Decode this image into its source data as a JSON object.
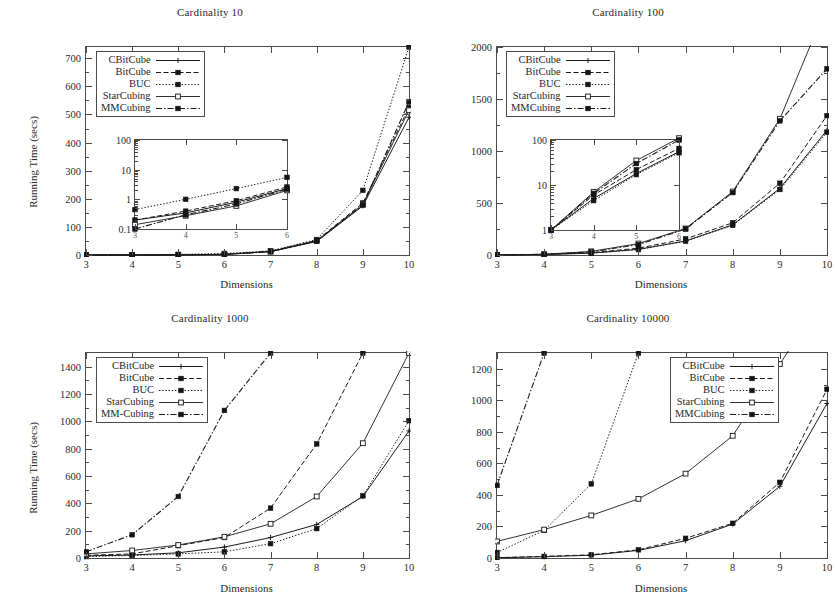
{
  "figure": {
    "background": "#ffffff",
    "ink": "#1a1a1a",
    "axis_color": "#4a4a4a"
  },
  "common": {
    "xlabel": "Dimensions",
    "ylabel": "Running Time (secs)",
    "x_ticks": [
      "3",
      "4",
      "5",
      "6",
      "7",
      "8",
      "9",
      "10"
    ],
    "series_names": [
      "CBitCube",
      "BitCube",
      "BUC",
      "StarCubing",
      "MMCubing"
    ]
  },
  "panels": [
    {
      "id": "cardinality-10",
      "title": "Cardinality 10",
      "ylabel": "Running Time (secs)",
      "xlabel": "Dimensions",
      "legend_position": "top-left",
      "legend_labels": [
        "CBitCube",
        "BitCube",
        "BUC",
        "StarCubing",
        "MMCubing"
      ],
      "y_ticks": [
        "0",
        "100",
        "200",
        "300",
        "400",
        "500",
        "600",
        "700"
      ],
      "inset": {
        "y_ticks": [
          "0.1",
          "1",
          "10",
          "100"
        ],
        "x_ticks": [
          "3",
          "4",
          "5",
          "6"
        ]
      },
      "chart_data": {
        "type": "line",
        "title": "Cardinality 10",
        "xlabel": "Dimensions",
        "ylabel": "Running Time (secs)",
        "x": [
          3,
          4,
          5,
          6,
          7,
          8,
          9,
          10
        ],
        "xlim": [
          3,
          10
        ],
        "ylim": [
          0,
          740
        ],
        "grid": false,
        "legend": "top-left",
        "series": [
          {
            "name": "CBitCube",
            "values": [
              0.2,
              0.35,
              0.8,
              2.3,
              12,
              48,
              175,
              490
            ]
          },
          {
            "name": "BitCube",
            "values": [
              0.2,
              0.4,
              0.9,
              2.6,
              13,
              52,
              185,
              525
            ]
          },
          {
            "name": "BUC",
            "values": [
              0.45,
              1.0,
              2.3,
              5.5,
              15,
              55,
              230,
              740
            ]
          },
          {
            "name": "StarCubing",
            "values": [
              0.14,
              0.28,
              0.6,
              2.0,
              12,
              50,
              180,
              515
            ]
          },
          {
            "name": "MMCubing",
            "values": [
              0.13,
              0.3,
              0.7,
              2.2,
              12,
              50,
              178,
              545
            ]
          }
        ],
        "inset": {
          "type": "line",
          "yscale": "log",
          "x": [
            3,
            4,
            5,
            6
          ],
          "xlim": [
            3,
            6
          ],
          "ylim": [
            0.1,
            100
          ],
          "y_ticks": [
            0.1,
            1,
            10,
            100
          ],
          "series": [
            {
              "name": "CBitCube",
              "values": [
                0.2,
                0.35,
                0.8,
                2.3
              ]
            },
            {
              "name": "BitCube",
              "values": [
                0.2,
                0.4,
                0.9,
                2.6
              ]
            },
            {
              "name": "BUC",
              "values": [
                0.45,
                1.0,
                2.3,
                5.5
              ]
            },
            {
              "name": "StarCubing",
              "values": [
                0.14,
                0.28,
                0.6,
                2.0
              ]
            },
            {
              "name": "MMCubing",
              "values": [
                0.1,
                0.3,
                0.7,
                2.2
              ]
            }
          ]
        }
      }
    },
    {
      "id": "cardinality-100",
      "title": "Cardinality 100",
      "ylabel": "",
      "xlabel": "Dimensions",
      "legend_position": "top-left",
      "legend_labels": [
        "CBitCube",
        "BitCube",
        "BUC",
        "StarCubing",
        "MMCubing"
      ],
      "y_ticks": [
        "0",
        "500",
        "1000",
        "1500",
        "2000"
      ],
      "inset": {
        "y_ticks": [
          "1",
          "10",
          "100"
        ],
        "x_ticks": [
          "3",
          "4",
          "5",
          "6"
        ]
      },
      "chart_data": {
        "type": "line",
        "title": "Cardinality 100",
        "xlabel": "Dimensions",
        "ylabel": "Running Time (secs)",
        "x": [
          3,
          4,
          5,
          6,
          7,
          8,
          9,
          10
        ],
        "xlim": [
          3,
          10
        ],
        "ylim": [
          0,
          2000
        ],
        "grid": false,
        "legend": "top-left",
        "series": [
          {
            "name": "CBitCube",
            "values": [
              1,
              5,
              18,
              55,
              135,
              290,
              640,
              1200
            ]
          },
          {
            "name": "BitCube",
            "values": [
              1,
              6,
              22,
              65,
              155,
              310,
              690,
              1340
            ]
          },
          {
            "name": "BUC",
            "values": [
              1,
              4.5,
              17,
              52,
              133,
              285,
              630,
              1180
            ]
          },
          {
            "name": "StarCubing",
            "values": [
              1,
              7,
              35,
              110,
              255,
              610,
              1310,
              2400
            ]
          },
          {
            "name": "MMCubing",
            "values": [
              1,
              6.5,
              30,
              100,
              250,
              600,
              1290,
              1790
            ]
          }
        ],
        "inset": {
          "type": "line",
          "yscale": "log",
          "x": [
            3,
            4,
            5,
            6
          ],
          "xlim": [
            3,
            6
          ],
          "ylim": [
            1,
            100
          ],
          "y_ticks": [
            1,
            10,
            100
          ],
          "series": [
            {
              "name": "CBitCube",
              "values": [
                1,
                5,
                18,
                55
              ]
            },
            {
              "name": "BitCube",
              "values": [
                1,
                6,
                22,
                65
              ]
            },
            {
              "name": "BUC",
              "values": [
                1,
                4.5,
                17,
                52
              ]
            },
            {
              "name": "StarCubing",
              "values": [
                1,
                7,
                35,
                110
              ]
            },
            {
              "name": "MMCubing",
              "values": [
                1,
                6.5,
                30,
                100
              ]
            }
          ]
        }
      }
    },
    {
      "id": "cardinality-1000",
      "title": "Cardinality 1000",
      "ylabel": "Running Time (secs)",
      "xlabel": "Dimensions",
      "legend_position": "top-left",
      "legend_labels": [
        "CBitCube",
        "BitCube",
        "BUC",
        "StarCubing",
        "MM-Cubing"
      ],
      "y_ticks": [
        "0",
        "200",
        "400",
        "600",
        "800",
        "1000",
        "1200",
        "1400"
      ],
      "chart_data": {
        "type": "line",
        "title": "Cardinality 1000",
        "xlabel": "Dimensions",
        "ylabel": "Running Time (secs)",
        "x": [
          3,
          4,
          5,
          6,
          7,
          8,
          9,
          10
        ],
        "xlim": [
          3,
          10
        ],
        "ylim": [
          0,
          1500
        ],
        "grid": false,
        "legend": "top-left",
        "series": [
          {
            "name": "CBitCube",
            "values": [
              15,
              22,
              38,
              80,
              150,
              245,
              450,
              930
            ]
          },
          {
            "name": "BitCube",
            "values": [
              20,
              30,
              90,
              150,
              365,
              835,
              1500,
              null
            ]
          },
          {
            "name": "BUC",
            "values": [
              10,
              18,
              30,
              45,
              105,
              215,
              455,
              1005
            ]
          },
          {
            "name": "StarCubing",
            "values": [
              30,
              55,
              95,
              155,
              250,
              450,
              840,
              1500
            ]
          },
          {
            "name": "MM-Cubing",
            "values": [
              45,
              170,
              450,
              1080,
              1500,
              null,
              null,
              null
            ]
          }
        ]
      }
    },
    {
      "id": "cardinality-10000",
      "title": "Cardinality 10000",
      "ylabel": "",
      "xlabel": "Dimensions",
      "legend_position": "top-right",
      "legend_labels": [
        "CBitCube",
        "BitCube",
        "BUC",
        "StarCubing",
        "MMCubing"
      ],
      "y_ticks": [
        "0",
        "200",
        "400",
        "600",
        "800",
        "1000",
        "1200"
      ],
      "chart_data": {
        "type": "line",
        "title": "Cardinality 10000",
        "xlabel": "Dimensions",
        "ylabel": "Running Time (secs)",
        "x": [
          3,
          4,
          5,
          6,
          7,
          8,
          9,
          10
        ],
        "xlim": [
          3,
          10
        ],
        "ylim": [
          0,
          1300
        ],
        "grid": false,
        "legend": "top-right",
        "series": [
          {
            "name": "CBitCube",
            "values": [
              2,
              8,
              18,
              48,
              110,
              215,
              455,
              980
            ]
          },
          {
            "name": "BitCube",
            "values": [
              2,
              10,
              20,
              52,
              125,
              220,
              480,
              1070
            ]
          },
          {
            "name": "BUC",
            "values": [
              35,
              175,
              470,
              1300,
              null,
              null,
              null,
              null
            ]
          },
          {
            "name": "StarCubing",
            "values": [
              105,
              180,
              270,
              375,
              535,
              775,
              1230,
              null
            ]
          },
          {
            "name": "MMCubing",
            "values": [
              460,
              1300,
              null,
              null,
              null,
              null,
              null,
              null
            ]
          }
        ]
      }
    }
  ]
}
